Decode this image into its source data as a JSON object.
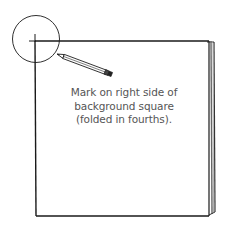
{
  "diagram": {
    "type": "craft-instruction-illustration",
    "caption": {
      "line1": "Mark on right side of",
      "line2": "background square",
      "line3": "(folded in fourths)."
    },
    "elements": {
      "square": "folded background square with stacked layered edge on right",
      "circle": "magnifier highlight circle around top-left corner mark",
      "pencil": "pencil marking the corner",
      "corner_mark": "cross-hair mark at top-left corner"
    },
    "colors": {
      "line": "#1a1a1a",
      "caption_text": "#555555",
      "layer_shade": "#777777",
      "background": "#ffffff"
    }
  }
}
